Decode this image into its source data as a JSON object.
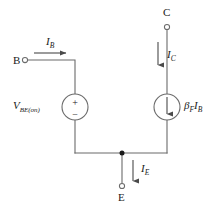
{
  "diagram": {
    "stroke_color": "#5a5a5a",
    "text_color": "#1a1a1a",
    "background": "#ffffff"
  },
  "terminals": [
    {
      "id": "base",
      "label": "B",
      "name": "terminal-b"
    },
    {
      "id": "collector",
      "label": "C",
      "name": "terminal-c"
    },
    {
      "id": "emitter",
      "label": "E",
      "name": "terminal-e"
    }
  ],
  "currents": [
    {
      "id": "ib",
      "symbol": "I",
      "subscript": "B",
      "direction": "right",
      "name": "current-ib"
    },
    {
      "id": "ic",
      "symbol": "I",
      "subscript": "C",
      "direction": "down",
      "name": "current-ic"
    },
    {
      "id": "ie",
      "symbol": "I",
      "subscript": "E",
      "direction": "down",
      "name": "current-ie"
    }
  ],
  "sources": {
    "voltage_source": {
      "symbol": "V",
      "subscript": "BE(on)",
      "plus": "+",
      "minus": "−",
      "type": "independent-voltage-source"
    },
    "current_source": {
      "symbol": "β",
      "subscript_1": "F",
      "factor": "I",
      "subscript_2": "B",
      "type": "dependent-current-source",
      "arrow_direction": "down"
    }
  }
}
